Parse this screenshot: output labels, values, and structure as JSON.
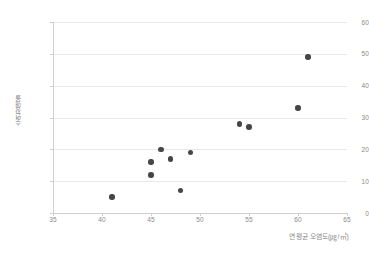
{
  "chart_data": {
    "type": "scatter",
    "title": "",
    "subtitle": "",
    "xlabel": "연평균 오염도(㎍/㎥)",
    "ylabel": "수면장애율",
    "xlim": [
      35,
      65
    ],
    "ylim": [
      0,
      60
    ],
    "xticks": [
      "35",
      "40",
      "45",
      "50",
      "55",
      "60",
      "65"
    ],
    "yticks": [
      "0",
      "10",
      "20",
      "30",
      "40",
      "50",
      "60"
    ],
    "xtick_values": [
      35,
      40,
      45,
      50,
      55,
      60,
      65
    ],
    "ytick_values": [
      0,
      10,
      20,
      30,
      40,
      50,
      60
    ],
    "grid": "horizontal",
    "legend": "none",
    "marker_color": "#464646",
    "grid_color": "#e8e8e8",
    "axis_color": "#cfcfcf",
    "series": [
      {
        "name": "관측값",
        "points": [
          {
            "x": 41,
            "y": 5
          },
          {
            "x": 45,
            "y": 12
          },
          {
            "x": 45,
            "y": 16
          },
          {
            "x": 46,
            "y": 20
          },
          {
            "x": 47,
            "y": 17
          },
          {
            "x": 48,
            "y": 7
          },
          {
            "x": 49,
            "y": 19
          },
          {
            "x": 54,
            "y": 28
          },
          {
            "x": 55,
            "y": 27
          },
          {
            "x": 60,
            "y": 33
          },
          {
            "x": 61,
            "y": 49
          }
        ]
      }
    ]
  }
}
